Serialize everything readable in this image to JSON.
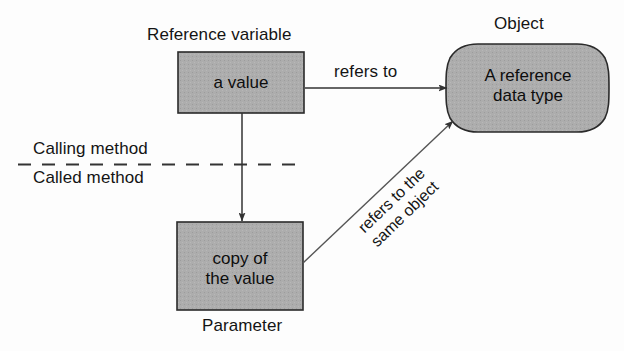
{
  "diagram": {
    "title_alt": "Reference variable passed to a method",
    "background_color": "#fdfdfd",
    "box_fill_color": "#ababab",
    "stroke_color": "#222222",
    "captions": {
      "reference_variable": "Reference variable",
      "object": "Object",
      "calling_method": "Calling method",
      "called_method": "Called method",
      "parameter": "Parameter"
    },
    "nodes": {
      "a_value": {
        "label": "a value",
        "shape": "rectangle"
      },
      "object_body": {
        "line1": "A reference",
        "line2": "data type",
        "shape": "rounded-cylinder"
      },
      "copy_of_value": {
        "line1": "copy of",
        "line2": "the value",
        "shape": "rectangle"
      }
    },
    "edges": {
      "refers_to": {
        "label": "refers to",
        "from": "a_value",
        "to": "object_body"
      },
      "copies_into": {
        "label": "",
        "from": "a_value",
        "to": "copy_of_value"
      },
      "refers_same_object": {
        "line1": "refers to the",
        "line2": "same object",
        "from": "copy_of_value",
        "to": "object_body"
      }
    },
    "divider": {
      "style": "dashed",
      "above_label": "Calling method",
      "below_label": "Called method"
    }
  }
}
